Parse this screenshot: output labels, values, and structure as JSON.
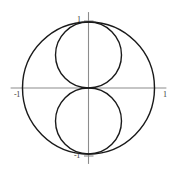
{
  "figure": {
    "background_color": "#ffffff",
    "axis_color": "#808080",
    "curve_color": "#1a1a1a",
    "label_color": "#3a3a3a"
  },
  "axes": {
    "x_label_negative": "-1",
    "x_label_positive": "1",
    "y_label_positive": "1",
    "y_label_negative": "-1"
  },
  "chart_data": {
    "type": "line",
    "plot_style": "polar",
    "title": "",
    "subtitle": "",
    "xlabel": "",
    "ylabel": "",
    "xlim": [
      -1.18,
      1.18
    ],
    "ylim": [
      -1.15,
      1.15
    ],
    "grid": false,
    "legend": null,
    "aspect": "equal",
    "xticks": [
      -1,
      1
    ],
    "xtick_labels": [
      "-1",
      "1"
    ],
    "yticks": [
      -1,
      1
    ],
    "ytick_labels": [
      "-1",
      "1"
    ],
    "annotations": [],
    "series": [
      {
        "name": "r = 1",
        "kind": "circle",
        "center": [
          0,
          0
        ],
        "radius": 1.0,
        "color": "#1a1a1a",
        "linewidth": 1.4
      },
      {
        "name": "r = sin(theta)",
        "kind": "circle",
        "center": [
          0,
          0.5
        ],
        "radius": 0.5,
        "color": "#1a1a1a",
        "linewidth": 1.4
      },
      {
        "name": "r = -sin(theta)",
        "kind": "circle",
        "center": [
          0,
          -0.5
        ],
        "radius": 0.5,
        "color": "#1a1a1a",
        "linewidth": 1.4
      }
    ]
  }
}
